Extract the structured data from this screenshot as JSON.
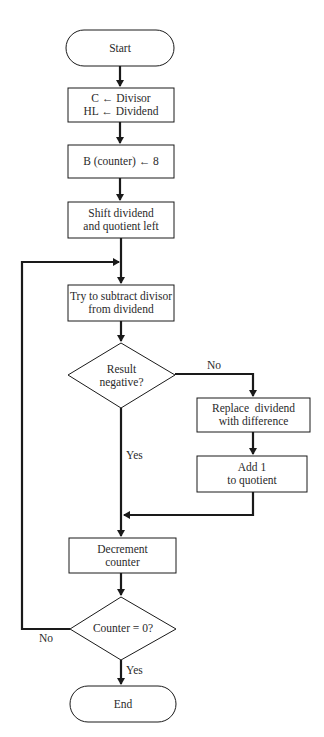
{
  "diagram": {
    "type": "flowchart",
    "stroke_color": "#1a1a1a",
    "nodes": {
      "start": {
        "shape": "terminal",
        "text": "Start"
      },
      "init_regs": {
        "shape": "process",
        "line1": "C ← Divisor",
        "line2": "HL ← Dividend"
      },
      "init_counter": {
        "shape": "process",
        "text": "B (counter) ← 8"
      },
      "shift": {
        "shape": "process",
        "line1": "Shift dividend",
        "line2": "and quotient left"
      },
      "subtract": {
        "shape": "process",
        "line1": "Try to subtract divisor",
        "line2": "from dividend"
      },
      "negative": {
        "shape": "decision",
        "line1": "Result",
        "line2": "negative?"
      },
      "replace": {
        "shape": "process",
        "line1": "Replace  dividend",
        "line2": "with difference"
      },
      "add1": {
        "shape": "process",
        "line1": "Add 1",
        "line2": "to quotient"
      },
      "decrement": {
        "shape": "process",
        "line1": "Decrement",
        "line2": "counter"
      },
      "counter_zero": {
        "shape": "decision",
        "text": "Counter = 0?"
      },
      "end": {
        "shape": "terminal",
        "text": "End"
      }
    },
    "edge_labels": {
      "negative_no": "No",
      "negative_yes": "Yes",
      "counter_no": "No",
      "counter_yes": "Yes"
    },
    "edges": [
      {
        "from": "start",
        "to": "init_regs"
      },
      {
        "from": "init_regs",
        "to": "init_counter"
      },
      {
        "from": "init_counter",
        "to": "shift"
      },
      {
        "from": "shift",
        "to": "subtract"
      },
      {
        "from": "subtract",
        "to": "negative"
      },
      {
        "from": "negative",
        "to": "replace",
        "label": "No"
      },
      {
        "from": "replace",
        "to": "add1"
      },
      {
        "from": "add1",
        "to": "decrement"
      },
      {
        "from": "negative",
        "to": "decrement",
        "label": "Yes"
      },
      {
        "from": "decrement",
        "to": "counter_zero"
      },
      {
        "from": "counter_zero",
        "to": "subtract",
        "label": "No"
      },
      {
        "from": "counter_zero",
        "to": "end",
        "label": "Yes"
      }
    ]
  }
}
